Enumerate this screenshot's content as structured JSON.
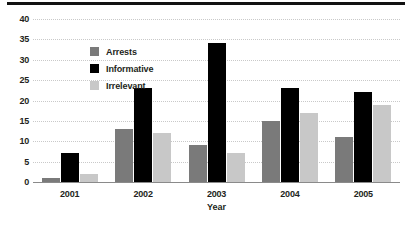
{
  "chart_data": {
    "type": "bar",
    "title": "",
    "subtitle": "",
    "xlabel": "Year",
    "ylabel": "",
    "categories": [
      "2001",
      "2002",
      "2003",
      "2004",
      "2005"
    ],
    "series": [
      {
        "name": "Arrests",
        "color": "#7a7a7a",
        "values": [
          1,
          13,
          9,
          15,
          11
        ]
      },
      {
        "name": "Informative",
        "color": "#000000",
        "values": [
          7,
          23,
          34,
          23,
          22
        ]
      },
      {
        "name": "Irrelevant",
        "color": "#c8c8c8",
        "values": [
          2,
          12,
          7,
          17,
          19
        ]
      }
    ],
    "ylim": [
      0,
      40
    ],
    "ytick_step": 5,
    "yticks": [
      "40",
      "35",
      "30",
      "25",
      "20",
      "15",
      "10",
      "5",
      "0"
    ],
    "grid": true,
    "grid_axis": "y",
    "grid_style": "dotted",
    "grid_color": "#c9c9c9",
    "legend_position": "inside-upper-left",
    "axis_color": "#8a8a8a",
    "text_color": "#231f20",
    "background": "#ffffff"
  },
  "decor": {
    "top_rule_color": "#111111"
  }
}
